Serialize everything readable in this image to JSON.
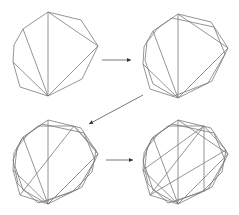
{
  "diagram": {
    "title": "",
    "stroke_color": "#7a7a7a",
    "arrow_color": "#555555",
    "stages": [
      {
        "id": "stage-1",
        "label": "",
        "outer_polygon_sides": 9,
        "inner_polygons": 0,
        "diagonals": 5
      },
      {
        "id": "stage-2",
        "label": "",
        "outer_polygon_sides": 9,
        "inner_polygons": 1,
        "diagonals": 5
      },
      {
        "id": "stage-3",
        "label": "",
        "outer_polygon_sides": 9,
        "inner_polygons": 2,
        "diagonals": 6
      },
      {
        "id": "stage-4",
        "label": "",
        "outer_polygon_sides": 9,
        "inner_polygons": 2,
        "diagonals": 9
      }
    ],
    "arrows": [
      {
        "from": "stage-1",
        "to": "stage-2",
        "direction": "right"
      },
      {
        "from": "stage-2",
        "to": "stage-3",
        "direction": "down-left"
      },
      {
        "from": "stage-3",
        "to": "stage-4",
        "direction": "right"
      }
    ]
  }
}
